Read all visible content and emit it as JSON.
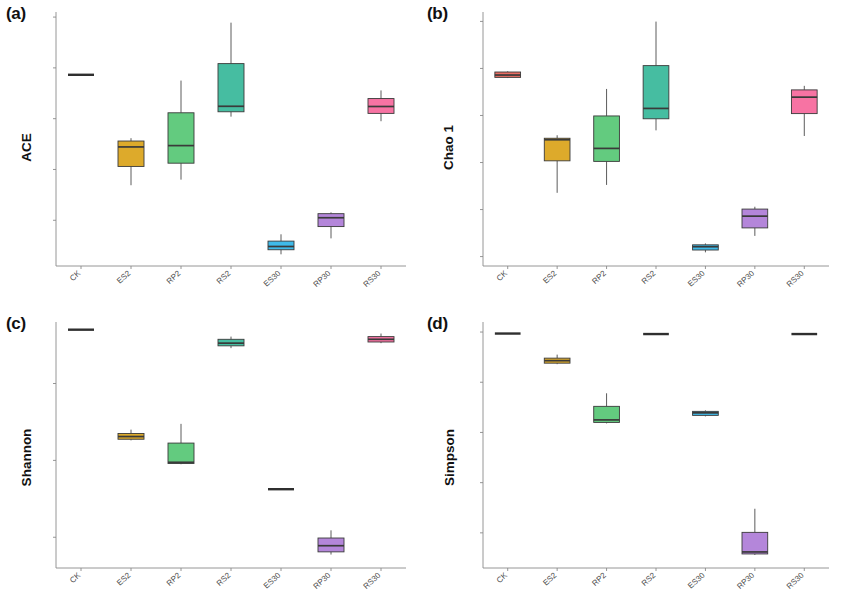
{
  "figure": {
    "panels": [
      {
        "key": "a",
        "label": "(a)",
        "ylabel": "ACE",
        "ymin": 1550,
        "ymax": 4050,
        "yticks": [
          2000,
          2500,
          3000,
          3500,
          4000
        ],
        "ytick_labels": [
          "2000",
          "2500",
          "3000",
          "3500",
          "4000"
        ]
      },
      {
        "key": "b",
        "label": "(b)",
        "ylabel": "Chao 1",
        "ymin": 1400,
        "ymax": 4100,
        "yticks": [
          1500,
          2000,
          2500,
          3000,
          3500,
          4000
        ],
        "ytick_labels": [
          "1500",
          "2000",
          "2500",
          "3000",
          "3500",
          "4000"
        ]
      },
      {
        "key": "c",
        "label": "(c)",
        "ylabel": "Shannon",
        "ymin": 3.2,
        "ymax": 9.6,
        "yticks": [
          4,
          6,
          8
        ],
        "ytick_labels": [
          "4",
          "6",
          "8"
        ]
      },
      {
        "key": "d",
        "label": "(d)",
        "ylabel": "Simpson",
        "ymin": 0.53,
        "ymax": 1.02,
        "yticks": [
          0.6,
          0.7,
          0.8,
          0.9,
          1.0
        ],
        "ytick_labels": [
          "0.6",
          "0.7",
          "0.8",
          "0.9",
          "1.0"
        ]
      }
    ]
  },
  "chart_data": [
    {
      "type": "box",
      "panel": "a",
      "title": "(a)",
      "ylabel": "ACE",
      "xlabel": "",
      "ylim": [
        1550,
        4050
      ],
      "grid": false,
      "legend": "none",
      "categories": [
        "CK",
        "ES2",
        "RP2",
        "RS2",
        "ES30",
        "RP30",
        "RS30"
      ],
      "colors": [
        "#E8655B",
        "#DBA520",
        "#5BC878",
        "#3CB99C",
        "#35B6E8",
        "#B07FD8",
        "#F76C9E"
      ],
      "boxes": [
        {
          "category": "CK",
          "min": 3430,
          "q1": 3430,
          "median": 3432,
          "q3": 3435,
          "max": 3435,
          "degenerate": true
        },
        {
          "category": "ES2",
          "min": 2345,
          "q1": 2530,
          "median": 2722,
          "q3": 2780,
          "max": 2808,
          "degenerate": false
        },
        {
          "category": "RP2",
          "min": 2400,
          "q1": 2562,
          "median": 2735,
          "q3": 3058,
          "max": 3375,
          "degenerate": false
        },
        {
          "category": "RS2",
          "min": 3020,
          "q1": 3068,
          "median": 3122,
          "q3": 3542,
          "max": 3945,
          "degenerate": false
        },
        {
          "category": "ES30",
          "min": 1665,
          "q1": 1710,
          "median": 1742,
          "q3": 1795,
          "max": 1862,
          "degenerate": false
        },
        {
          "category": "RP30",
          "min": 1822,
          "q1": 1938,
          "median": 2025,
          "q3": 2065,
          "max": 2078,
          "degenerate": false
        },
        {
          "category": "RS30",
          "min": 2975,
          "q1": 3052,
          "median": 3120,
          "q3": 3198,
          "max": 3278,
          "degenerate": false
        }
      ]
    },
    {
      "type": "box",
      "panel": "b",
      "title": "(b)",
      "ylabel": "Chao 1",
      "xlabel": "",
      "ylim": [
        1400,
        4100
      ],
      "grid": false,
      "legend": "none",
      "categories": [
        "CK",
        "ES2",
        "RP2",
        "RS2",
        "ES30",
        "RP30",
        "RS30"
      ],
      "colors": [
        "#E8655B",
        "#DBA520",
        "#5BC878",
        "#3CB99C",
        "#35B6E8",
        "#B07FD8",
        "#F76C9E"
      ],
      "boxes": [
        {
          "category": "CK",
          "min": 3398,
          "q1": 3405,
          "median": 3430,
          "q3": 3462,
          "max": 3470,
          "degenerate": false
        },
        {
          "category": "ES2",
          "min": 2178,
          "q1": 2518,
          "median": 2742,
          "q3": 2758,
          "max": 2790,
          "degenerate": false
        },
        {
          "category": "RP2",
          "min": 2262,
          "q1": 2512,
          "median": 2650,
          "q3": 2995,
          "max": 3282,
          "degenerate": false
        },
        {
          "category": "RS2",
          "min": 2842,
          "q1": 2965,
          "median": 3075,
          "q3": 3530,
          "max": 3998,
          "degenerate": false
        },
        {
          "category": "ES30",
          "min": 1545,
          "q1": 1570,
          "median": 1605,
          "q3": 1625,
          "max": 1640,
          "degenerate": false
        },
        {
          "category": "RP30",
          "min": 1720,
          "q1": 1805,
          "median": 1930,
          "q3": 2005,
          "max": 2030,
          "degenerate": false
        },
        {
          "category": "RS30",
          "min": 2782,
          "q1": 3020,
          "median": 3195,
          "q3": 3272,
          "max": 3315,
          "degenerate": false
        }
      ]
    },
    {
      "type": "box",
      "panel": "c",
      "title": "(c)",
      "ylabel": "Shannon",
      "xlabel": "",
      "ylim": [
        3.2,
        9.6
      ],
      "grid": false,
      "legend": "none",
      "categories": [
        "CK",
        "ES2",
        "RP2",
        "RS2",
        "ES30",
        "RP30",
        "RS30"
      ],
      "colors": [
        "#E8655B",
        "#DBA520",
        "#5BC878",
        "#3CB99C",
        "#35B6E8",
        "#B07FD8",
        "#F76C9E"
      ],
      "boxes": [
        {
          "category": "CK",
          "min": 9.38,
          "q1": 9.38,
          "median": 9.4,
          "q3": 9.42,
          "max": 9.42,
          "degenerate": true
        },
        {
          "category": "ES2",
          "min": 6.52,
          "q1": 6.55,
          "median": 6.62,
          "q3": 6.7,
          "max": 6.8,
          "degenerate": false
        },
        {
          "category": "RP2",
          "min": 5.9,
          "q1": 5.92,
          "median": 5.95,
          "q3": 6.45,
          "max": 6.95,
          "degenerate": false
        },
        {
          "category": "RS2",
          "min": 8.92,
          "q1": 8.98,
          "median": 9.05,
          "q3": 9.15,
          "max": 9.22,
          "degenerate": false
        },
        {
          "category": "ES30",
          "min": 5.24,
          "q1": 5.24,
          "median": 5.25,
          "q3": 5.26,
          "max": 5.26,
          "degenerate": true
        },
        {
          "category": "RP30",
          "min": 3.55,
          "q1": 3.62,
          "median": 3.78,
          "q3": 3.98,
          "max": 4.18,
          "degenerate": false
        },
        {
          "category": "RS30",
          "min": 9.05,
          "q1": 9.08,
          "median": 9.15,
          "q3": 9.22,
          "max": 9.3,
          "degenerate": false
        }
      ]
    },
    {
      "type": "box",
      "panel": "d",
      "title": "(d)",
      "ylabel": "Simpson",
      "xlabel": "",
      "ylim": [
        0.53,
        1.02
      ],
      "grid": false,
      "legend": "none",
      "categories": [
        "CK",
        "ES2",
        "RP2",
        "RS2",
        "ES30",
        "RP30",
        "RS30"
      ],
      "colors": [
        "#E8655B",
        "#DBA520",
        "#5BC878",
        "#3CB99C",
        "#35B6E8",
        "#B07FD8",
        "#F76C9E"
      ],
      "boxes": [
        {
          "category": "CK",
          "min": 0.996,
          "q1": 0.996,
          "median": 0.997,
          "q3": 0.998,
          "max": 0.998,
          "degenerate": true
        },
        {
          "category": "ES2",
          "min": 0.936,
          "q1": 0.938,
          "median": 0.943,
          "q3": 0.948,
          "max": 0.955,
          "degenerate": false
        },
        {
          "category": "RP2",
          "min": 0.818,
          "q1": 0.82,
          "median": 0.825,
          "q3": 0.852,
          "max": 0.878,
          "degenerate": false
        },
        {
          "category": "RS2",
          "min": 0.995,
          "q1": 0.995,
          "median": 0.996,
          "q3": 0.997,
          "max": 0.997,
          "degenerate": true
        },
        {
          "category": "ES30",
          "min": 0.832,
          "q1": 0.834,
          "median": 0.839,
          "q3": 0.842,
          "max": 0.844,
          "degenerate": false
        },
        {
          "category": "RP30",
          "min": 0.556,
          "q1": 0.558,
          "median": 0.562,
          "q3": 0.601,
          "max": 0.648,
          "degenerate": false
        },
        {
          "category": "RS30",
          "min": 0.995,
          "q1": 0.995,
          "median": 0.996,
          "q3": 0.997,
          "max": 0.997,
          "degenerate": true
        }
      ]
    }
  ],
  "style": {
    "line_color": "#4a4a4a",
    "median_color": "#3a3a3a",
    "spine_color": "#8a8a8a",
    "text_color": "#4a4a4a"
  }
}
